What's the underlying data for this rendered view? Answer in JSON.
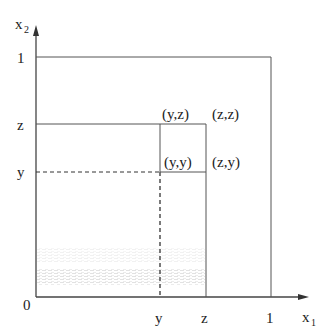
{
  "diagram": {
    "axes": {
      "x_label": "x",
      "x_subscript": "1",
      "y_label": "x",
      "y_subscript": "2",
      "origin_label": "0"
    },
    "x_ticks": [
      "y",
      "z",
      "1"
    ],
    "y_ticks": [
      "1",
      "z",
      "y"
    ],
    "points": {
      "yz": "(y,z)",
      "zz": "(z,z)",
      "yy": "(y,y)",
      "zy": "(z,y)"
    },
    "colors": {
      "line": "#444444",
      "shading": "#d8d8d8"
    }
  }
}
